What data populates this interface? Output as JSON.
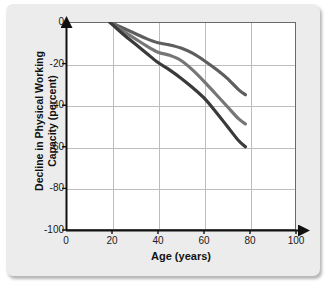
{
  "chart_data": {
    "type": "line",
    "title": "",
    "xlabel": "Age (years)",
    "ylabel_line1": "Decline in Physical Working",
    "ylabel_line2": "Capacity (percent)",
    "xlim": [
      0,
      100
    ],
    "ylim": [
      -100,
      0
    ],
    "xticks": [
      0,
      20,
      40,
      60,
      80,
      100
    ],
    "xtick_labels": [
      "0",
      "20",
      "40",
      "60",
      "80",
      "100"
    ],
    "yticks": [
      0,
      -20,
      -40,
      -60,
      -80,
      -100
    ],
    "ytick_labels": [
      "0",
      "-20",
      "-40",
      "-60",
      "-80",
      "-100"
    ],
    "grid": true,
    "grid_color": "#bdbdbd",
    "legend": "none",
    "series": [
      {
        "name": "upper-curve",
        "color": "#5e5e5e",
        "line_width": 3.2,
        "x": [
          19,
          25,
          30,
          35,
          40,
          45,
          50,
          55,
          60,
          65,
          70,
          75,
          78
        ],
        "y": [
          0,
          -3,
          -5.5,
          -8,
          -10,
          -11,
          -12.5,
          -15,
          -18.5,
          -22.5,
          -27,
          -32.5,
          -35
        ]
      },
      {
        "name": "middle-curve",
        "color": "#767676",
        "line_width": 3.2,
        "x": [
          19,
          25,
          30,
          35,
          40,
          45,
          50,
          55,
          60,
          65,
          70,
          75,
          78
        ],
        "y": [
          0,
          -4.5,
          -8,
          -11.5,
          -14.5,
          -16,
          -18.5,
          -23,
          -28.5,
          -34.5,
          -40.5,
          -46.5,
          -49
        ]
      },
      {
        "name": "lower-curve",
        "color": "#3a3a3a",
        "line_width": 3.2,
        "x": [
          19,
          25,
          30,
          35,
          40,
          45,
          50,
          55,
          60,
          65,
          70,
          75,
          78
        ],
        "y": [
          0,
          -6,
          -10.5,
          -15,
          -19.5,
          -23,
          -27,
          -31.5,
          -36.5,
          -43,
          -50,
          -57,
          -60
        ]
      }
    ]
  }
}
